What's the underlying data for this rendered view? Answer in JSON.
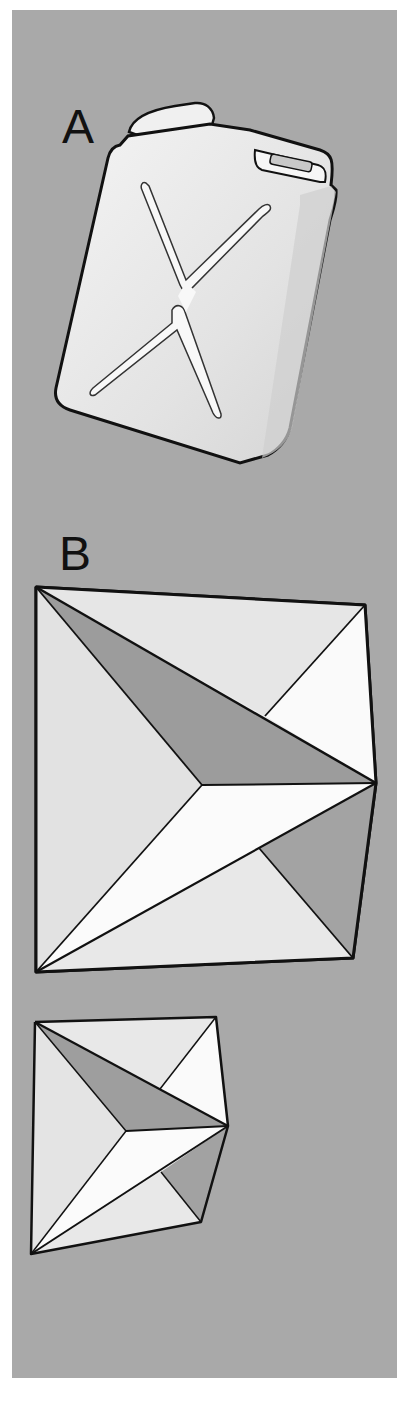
{
  "figure": {
    "background_color": "#a9a9a9",
    "panels": [
      {
        "label": "A",
        "subject": "jerrycan-illustration"
      },
      {
        "label": "B",
        "subject": "folded-polyhedron-large"
      },
      {
        "label": "",
        "subject": "folded-polyhedron-small"
      }
    ]
  }
}
